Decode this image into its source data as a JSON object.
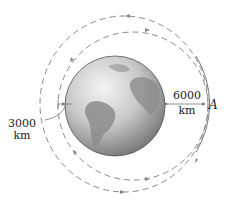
{
  "diagram": {
    "type": "orbit-transfer",
    "body": "Earth",
    "labels": {
      "left_distance_value": "3000",
      "left_distance_unit": "km",
      "right_distance_value": "6000",
      "right_distance_unit": "km",
      "point": "A"
    },
    "colors": {
      "orbit_dash": "#8a8a8a",
      "arc_solid": "#777777",
      "text": "#222222",
      "earth_light": "#e8e8e8",
      "earth_dark": "#7a7a7a"
    }
  }
}
